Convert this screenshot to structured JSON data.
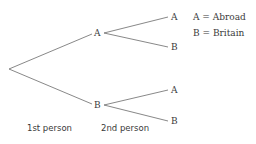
{
  "diagram": {
    "type": "probability-tree",
    "colors": {
      "line": "#6a6a6a",
      "text": "#3a3a3a",
      "background": "#ffffff"
    },
    "root": {
      "x": 9,
      "y": 69
    },
    "level1": [
      {
        "label": "A",
        "x": 97,
        "y": 33
      },
      {
        "label": "B",
        "x": 97,
        "y": 105
      }
    ],
    "level2": [
      {
        "parent": "A",
        "label": "A",
        "x": 174,
        "y": 17
      },
      {
        "parent": "A",
        "label": "B",
        "x": 174,
        "y": 47
      },
      {
        "parent": "B",
        "label": "A",
        "x": 174,
        "y": 90
      },
      {
        "parent": "B",
        "label": "B",
        "x": 174,
        "y": 121
      }
    ],
    "legend": [
      {
        "text": "A = Abroad"
      },
      {
        "text": "B = Britain"
      }
    ],
    "captions": {
      "first": "1st person",
      "second": "2nd person"
    }
  }
}
